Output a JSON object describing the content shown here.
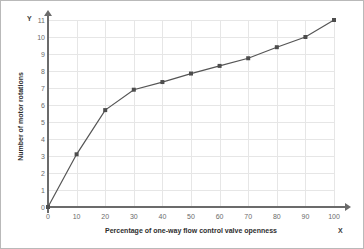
{
  "chart_data": {
    "type": "line",
    "title": "",
    "xlabel": "Percentage of one-way flow control valve openness",
    "ylabel": "Number of motor rotations",
    "x": [
      0,
      10,
      20,
      30,
      40,
      50,
      60,
      70,
      80,
      90,
      100
    ],
    "values": [
      0,
      3.1,
      5.7,
      6.9,
      7.35,
      7.85,
      8.3,
      8.75,
      9.4,
      10,
      11
    ],
    "series": [
      {
        "name": "Number of motor rotations",
        "values": [
          0,
          3.1,
          5.7,
          6.9,
          7.35,
          7.85,
          8.3,
          8.75,
          9.4,
          10,
          11
        ]
      }
    ],
    "xlim": [
      0,
      100
    ],
    "ylim": [
      0,
      11
    ],
    "xticks": [
      "0",
      "10",
      "20",
      "30",
      "40",
      "50",
      "60",
      "70",
      "80",
      "90",
      "100"
    ],
    "yticks": [
      "0",
      "1",
      "2",
      "3",
      "4",
      "5",
      "6",
      "7",
      "8",
      "9",
      "10",
      "11"
    ],
    "grid": true,
    "legend": "none",
    "marker": "square",
    "line_color": "#555555",
    "marker_color": "#4d4d4d",
    "grid_color": "#e6e6e6",
    "axis_color": "#6b6b6b"
  },
  "axis_letters": {
    "y": "Y",
    "x": "X"
  }
}
